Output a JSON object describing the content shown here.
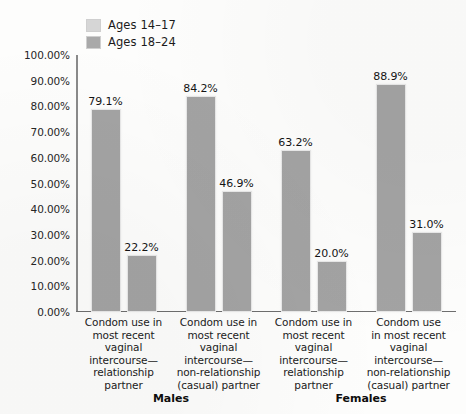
{
  "chart_data": {
    "type": "bar",
    "title": "",
    "subtitle": "",
    "xlabel": "",
    "ylabel": "",
    "ylim": [
      0,
      100
    ],
    "grid": false,
    "legend_position": "top-left",
    "ytick_labels": [
      "100.00%",
      "90.00%",
      "80.00%",
      "70.00%",
      "60.00%",
      "50.00%",
      "40.00%",
      "30.00%",
      "20.00%",
      "10.00%",
      "0.00%"
    ],
    "ytick_values": [
      100,
      90,
      80,
      70,
      60,
      50,
      40,
      30,
      20,
      10,
      0
    ],
    "categories": [
      "Condom use in most recent vaginal intercourse—relationship partner",
      "Condom use in most recent vaginal intercourse—non-relationship (casual) partner",
      "Condom use in most recent vaginal intercourse—relationship partner",
      "Condom use in most recent vaginal intercourse—non-relationship (casual) partner"
    ],
    "category_lines": [
      [
        "Condom use in",
        "most recent",
        "vaginal",
        "intercourse—",
        "relationship",
        "partner"
      ],
      [
        "Condom use in",
        "most recent",
        "vaginal",
        "intercourse—",
        "non-relationship",
        "(casual) partner"
      ],
      [
        "Condom use in",
        "most recent",
        "vaginal",
        "intercourse—",
        "relationship",
        "partner"
      ],
      [
        "Condom use",
        "in most recent",
        "vaginal",
        "intercourse—",
        "non-relationship",
        "(casual) partner"
      ]
    ],
    "groups": [
      "Males",
      "Females"
    ],
    "group_spans": [
      2,
      2
    ],
    "series": [
      {
        "name": "Ages 14–17",
        "color": "#d6d6d6",
        "values": [
          79.1,
          84.2,
          63.2,
          88.9
        ],
        "labels": [
          "79.1%",
          "84.2%",
          "63.2%",
          "88.9%"
        ]
      },
      {
        "name": "Ages 18–24",
        "color": "#a9a9a9",
        "values": [
          22.2,
          46.9,
          20.0,
          31.0
        ],
        "labels": [
          "22.2%",
          "46.9%",
          "20.0%",
          "31.0%"
        ]
      }
    ]
  },
  "legend": {
    "items": [
      {
        "label": "Ages 14–17",
        "swatch": "legend-swatch-light"
      },
      {
        "label": "Ages 18–24",
        "swatch": "legend-swatch-dark"
      }
    ]
  },
  "colors": {
    "bar_light": "#d6d6d6",
    "bar_dark": "#a9a9a9",
    "bar_render": "#a3a3a3",
    "axis": "#6e6e6e",
    "text": "#1b1b1b",
    "background": "#fdfdfc"
  }
}
